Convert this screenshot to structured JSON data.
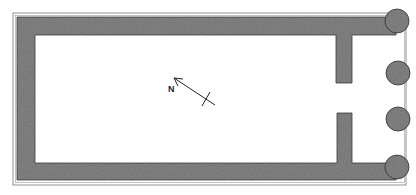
{
  "diagram": {
    "type": "floor-plan",
    "north_arrow": {
      "label": "N"
    },
    "elements": {
      "walls": [
        "left-wall",
        "top-wall",
        "bottom-wall",
        "upper-anta",
        "lower-anta"
      ],
      "columns": 4
    },
    "colors": {
      "wall_fill": "#6e6e6e",
      "background": "#ffffff",
      "outline": "#555555"
    }
  }
}
